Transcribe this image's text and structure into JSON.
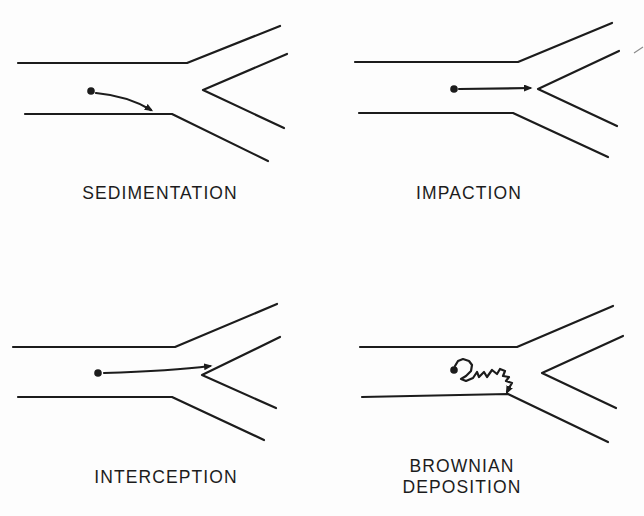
{
  "figure": {
    "background": "#fdfdfd",
    "ink": "#1c1c1c",
    "stroke_width": 2.2
  },
  "panels": [
    {
      "id": "sedimentation",
      "label": "SEDIMENTATION",
      "airway": {
        "top_wall": [
          [
            18,
            63
          ],
          [
            187,
            63
          ],
          [
            280,
            26
          ]
        ],
        "carina": [
          [
            287,
            54
          ],
          [
            203,
            90
          ],
          [
            284,
            128
          ]
        ],
        "bottom_wall": [
          [
            25,
            114
          ],
          [
            172,
            114
          ],
          [
            268,
            161
          ]
        ]
      },
      "particle": {
        "x": 91,
        "y": 91,
        "r": 3.8
      },
      "trajectory": {
        "kind": "quad",
        "points": [
          [
            96,
            93
          ],
          [
            128,
            96
          ],
          [
            151,
            110
          ]
        ]
      }
    },
    {
      "id": "impaction",
      "label": "IMPACTION",
      "airway": {
        "top_wall": [
          [
            355,
            62
          ],
          [
            518,
            62
          ],
          [
            612,
            23
          ]
        ],
        "carina": [
          [
            619,
            51
          ],
          [
            538,
            89
          ],
          [
            617,
            126
          ]
        ],
        "bottom_wall": [
          [
            359,
            113
          ],
          [
            513,
            113
          ],
          [
            608,
            157
          ]
        ]
      },
      "particle": {
        "x": 454,
        "y": 89,
        "r": 3.8
      },
      "trajectory": {
        "kind": "line",
        "points": [
          [
            459,
            89
          ],
          [
            530,
            88
          ]
        ]
      },
      "stray_marks": [
        [
          [
            634,
            53
          ],
          [
            643,
            47
          ]
        ]
      ]
    },
    {
      "id": "interception",
      "label": "INTERCEPTION",
      "airway": {
        "top_wall": [
          [
            13,
            347
          ],
          [
            175,
            347
          ],
          [
            277,
            304
          ]
        ],
        "carina": [
          [
            280,
            337
          ],
          [
            202,
            375
          ],
          [
            276,
            408
          ]
        ],
        "bottom_wall": [
          [
            18,
            397
          ],
          [
            172,
            397
          ],
          [
            264,
            440
          ]
        ]
      },
      "particle": {
        "x": 98,
        "y": 373,
        "r": 3.8
      },
      "trajectory": {
        "kind": "quad",
        "points": [
          [
            104,
            373
          ],
          [
            172,
            371
          ],
          [
            210,
            366
          ]
        ]
      }
    },
    {
      "id": "brownian-deposition",
      "label": "BROWNIAN\nDEPOSITION",
      "airway": {
        "top_wall": [
          [
            360,
            347
          ],
          [
            517,
            347
          ],
          [
            613,
            306
          ]
        ],
        "carina": [
          [
            623,
            336
          ],
          [
            542,
            373
          ],
          [
            616,
            408
          ]
        ],
        "bottom_wall": [
          [
            362,
            397
          ],
          [
            508,
            394
          ],
          [
            608,
            442
          ]
        ]
      },
      "particle": {
        "x": 454,
        "y": 370,
        "r": 3.8
      },
      "trajectory": {
        "kind": "poly",
        "points": [
          [
            455,
            366
          ],
          [
            458,
            361
          ],
          [
            463,
            359
          ],
          [
            469,
            361
          ],
          [
            472,
            365
          ],
          [
            471,
            371
          ],
          [
            466,
            376
          ],
          [
            461,
            379
          ],
          [
            466,
            381
          ],
          [
            473,
            378
          ],
          [
            477,
            372
          ],
          [
            479,
            377
          ],
          [
            484,
            372
          ],
          [
            487,
            377
          ],
          [
            492,
            370
          ],
          [
            497,
            374
          ],
          [
            500,
            369
          ],
          [
            505,
            371
          ],
          [
            503,
            376
          ],
          [
            509,
            377
          ],
          [
            506,
            381
          ],
          [
            512,
            383
          ],
          [
            509,
            388
          ],
          [
            507,
            392
          ]
        ]
      }
    }
  ]
}
